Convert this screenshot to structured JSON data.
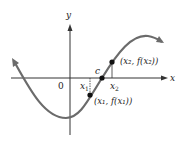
{
  "diagram": {
    "axes": {
      "x_label": "x",
      "y_label": "y",
      "origin_label": "0"
    },
    "points": {
      "c_label": "c",
      "x1_label": "x",
      "x1_sub": "1",
      "x2_label": "x",
      "x2_sub": "2",
      "p1_label": "(x₁, f(x₁))",
      "p2_label": "(x₂, f(x₂))"
    },
    "colors": {
      "curve": "#6b6b6b",
      "axis": "#333333",
      "point": "#111111"
    }
  }
}
